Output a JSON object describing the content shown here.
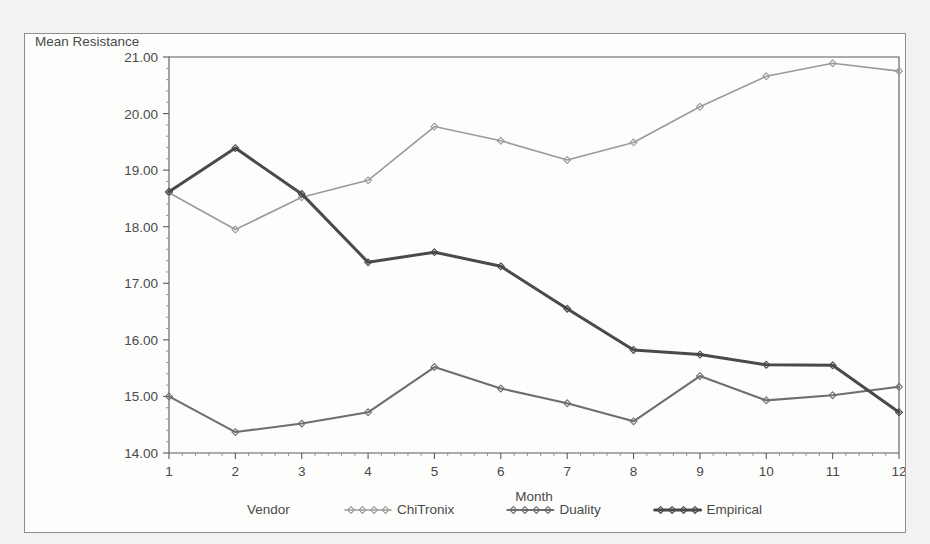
{
  "ghost_text": "partially cut-off text above chart",
  "chart_data": {
    "type": "line",
    "title": "",
    "xlabel": "Month",
    "ylabel": "Mean Resistance",
    "legend_title": "Vendor",
    "legend_position": "bottom",
    "grid": false,
    "x": [
      1,
      2,
      3,
      4,
      5,
      6,
      7,
      8,
      9,
      10,
      11,
      12
    ],
    "xtick_labels": [
      "1",
      "2",
      "3",
      "4",
      "5",
      "6",
      "7",
      "8",
      "9",
      "10",
      "11",
      "12"
    ],
    "xlim": [
      1,
      12
    ],
    "ylim": [
      14.0,
      21.0
    ],
    "ytick_labels": [
      "14.00",
      "15.00",
      "16.00",
      "17.00",
      "18.00",
      "19.00",
      "20.00",
      "21.00"
    ],
    "ytick_values": [
      14,
      15,
      16,
      17,
      18,
      19,
      20,
      21
    ],
    "y_minor_per_major": 5,
    "x_minor_per_major": 5,
    "series": [
      {
        "name": "ChiTronix",
        "color": "#9a9a9a",
        "width": 1.6,
        "marker": "diamond",
        "values": [
          18.6,
          17.95,
          18.52,
          18.82,
          19.77,
          19.52,
          19.18,
          19.49,
          20.12,
          20.66,
          20.89,
          20.75
        ]
      },
      {
        "name": "Duality",
        "color": "#6e6e6e",
        "width": 2.1,
        "marker": "diamond",
        "values": [
          15.0,
          14.37,
          14.52,
          14.72,
          15.52,
          15.14,
          14.88,
          14.56,
          15.36,
          14.93,
          15.02,
          15.17
        ]
      },
      {
        "name": "Empirical",
        "color": "#4a4a4a",
        "width": 3.0,
        "marker": "diamond",
        "values": [
          18.62,
          19.39,
          18.58,
          17.37,
          17.55,
          17.3,
          16.55,
          15.82,
          15.74,
          15.56,
          15.55,
          14.72
        ]
      }
    ]
  },
  "legend": {
    "title": "Vendor",
    "entries": [
      {
        "label": "ChiTronix",
        "color": "#9a9a9a"
      },
      {
        "label": "Duality",
        "color": "#6e6e6e"
      },
      {
        "label": "Empirical",
        "color": "#4a4a4a"
      }
    ]
  }
}
